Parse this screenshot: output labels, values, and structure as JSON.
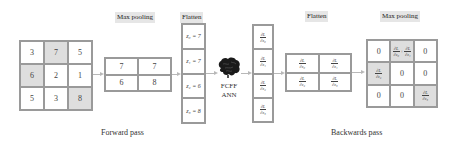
{
  "labels": {
    "max_pooling_fwd": "Max pooling",
    "flatten_fwd": "Flatten",
    "flatten_bwd": "Flatten",
    "max_pooling_bwd": "Max pooling",
    "forward_pass": "Forward pass",
    "backwards_pass": "Backwards pass",
    "ann_line1": "FCFF",
    "ann_line2": "ANN"
  },
  "input_grid": {
    "cells": [
      "3",
      "7",
      "5",
      "6",
      "2",
      "1",
      "5",
      "3",
      "8"
    ],
    "highlighted": [
      1,
      3,
      8
    ]
  },
  "pooled_grid": {
    "cells": [
      "7",
      "7",
      "6",
      "8"
    ]
  },
  "flatten_column": {
    "cells": [
      "z₀ = 7",
      "z₁ = 7",
      "z₂ = 6",
      "z₃ = 8"
    ]
  },
  "gradient_column": {
    "cells": [
      {
        "num": "∂L",
        "den": "∂z₀"
      },
      {
        "num": "∂L",
        "den": "∂z₁"
      },
      {
        "num": "∂L",
        "den": "∂z₂"
      },
      {
        "num": "∂L",
        "den": "∂z₃"
      }
    ]
  },
  "gradient_grid": {
    "cells": [
      {
        "num": "∂L",
        "den": "∂z₀"
      },
      {
        "num": "∂L",
        "den": "∂z₁"
      },
      {
        "num": "∂L",
        "den": "∂z₂"
      },
      {
        "num": "∂L",
        "den": "∂z₃"
      }
    ]
  },
  "output_grid": {
    "cells": [
      "0",
      "∂L/∂z₀ + ∂L/∂z₁",
      "0",
      "∂L/∂z₂",
      "0",
      "0",
      "0",
      "0",
      "∂L/∂z₃"
    ],
    "zero": "0",
    "g0": {
      "num": "∂L",
      "den": "∂z₀"
    },
    "g1": {
      "num": "∂L",
      "den": "∂z₁"
    },
    "g2": {
      "num": "∂L",
      "den": "∂z₂"
    },
    "g3": {
      "num": "∂L",
      "den": "∂z₃"
    },
    "plus": "+",
    "highlighted": [
      1,
      3,
      8
    ]
  },
  "colors": {
    "highlight": "#dedede",
    "border": "#9a9a9a",
    "label_bg": "#e6e6e6",
    "arrow": "#b8b8b8"
  }
}
